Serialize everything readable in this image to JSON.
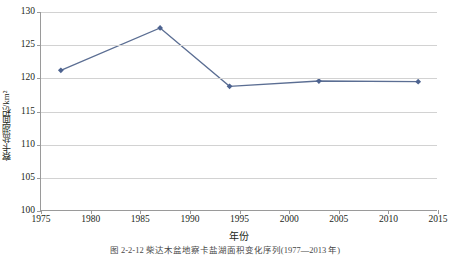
{
  "chart_data": {
    "type": "line",
    "title": "",
    "xlabel": "年份",
    "ylabel": "察卡盐湖面积/km²",
    "xlim": [
      1975,
      2015
    ],
    "ylim": [
      100,
      130
    ],
    "xticks": [
      1975,
      1980,
      1985,
      1990,
      1995,
      2000,
      2005,
      2010,
      2015
    ],
    "yticks": [
      100,
      105,
      110,
      115,
      120,
      125,
      130
    ],
    "grid": "horizontal",
    "legend": "none",
    "series": [
      {
        "name": "察卡盐湖面积",
        "x": [
          1977,
          1987,
          1994,
          2003,
          2013
        ],
        "values": [
          121.2,
          127.6,
          118.8,
          119.6,
          119.5
        ]
      }
    ],
    "line_color": "#5b6e93",
    "marker": "diamond",
    "marker_color": "#4d6390"
  },
  "caption": {
    "text": "图 2-2-12   柴达木盆地察卡盐湖面积变化序列(1977—2013 年)"
  },
  "colors": {
    "axis": "#9a9a9a",
    "grid": "#d2d2d2",
    "text": "#231f20",
    "series": "#5b6e93"
  }
}
